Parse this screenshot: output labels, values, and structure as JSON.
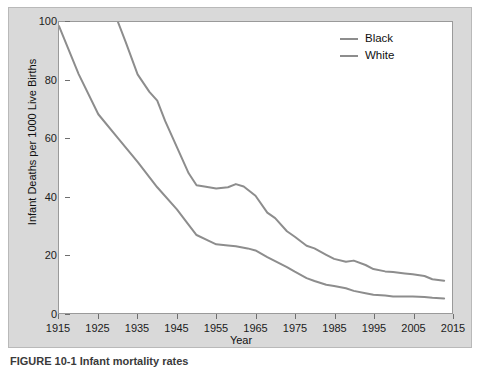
{
  "figure": {
    "caption": "FIGURE 10-1  Infant mortality rates"
  },
  "legend": {
    "position": "top-right",
    "entries": [
      {
        "label": "Black",
        "color": "#8d8d8d"
      },
      {
        "label": "White",
        "color": "#8d8d8d"
      }
    ]
  },
  "axes": {
    "x_title": "Year",
    "y_title": "Infant Deaths per 1000 Live Births",
    "x_ticks": [
      "1915",
      "1925",
      "1935",
      "1945",
      "1955",
      "1965",
      "1975",
      "1985",
      "1995",
      "2005",
      "2015"
    ],
    "y_ticks": [
      "0",
      "20",
      "40",
      "60",
      "80",
      "100"
    ]
  },
  "chart_data": {
    "type": "line",
    "title": "",
    "xlabel": "Year",
    "ylabel": "Infant Deaths per 1000 Live Births",
    "xlim": [
      1915,
      2015
    ],
    "ylim": [
      0,
      100
    ],
    "xticks": [
      1915,
      1925,
      1935,
      1945,
      1955,
      1965,
      1975,
      1985,
      1995,
      2005,
      2015
    ],
    "yticks": [
      0,
      20,
      40,
      60,
      80,
      100
    ],
    "grid": false,
    "legend_position": "top-right",
    "series": [
      {
        "name": "Black",
        "color": "#8d8d8d",
        "note": "Series enters the visible plot area at the top (value 100) near 1930; earlier values exceed the y-axis maximum.",
        "x": [
          1930,
          1932,
          1935,
          1938,
          1940,
          1942,
          1945,
          1948,
          1950,
          1952,
          1955,
          1958,
          1960,
          1962,
          1965,
          1968,
          1970,
          1973,
          1975,
          1978,
          1980,
          1983,
          1985,
          1988,
          1990,
          1993,
          1995,
          1998,
          2000,
          2003,
          2005,
          2008,
          2010,
          2013
        ],
        "y": [
          100,
          93,
          82,
          76,
          73,
          66,
          57,
          48,
          43.9,
          43.5,
          42.8,
          43.2,
          44.3,
          43.5,
          40.3,
          34.5,
          32.6,
          28.1,
          26.2,
          23.1,
          22.2,
          20.0,
          18.6,
          17.6,
          18.0,
          16.5,
          15.1,
          14.3,
          14.1,
          13.6,
          13.3,
          12.7,
          11.6,
          11.1
        ]
      },
      {
        "name": "White",
        "color": "#8d8d8d",
        "x": [
          1915,
          1920,
          1925,
          1930,
          1935,
          1940,
          1945,
          1948,
          1950,
          1953,
          1955,
          1958,
          1960,
          1963,
          1965,
          1968,
          1970,
          1973,
          1975,
          1978,
          1980,
          1983,
          1985,
          1988,
          1990,
          1993,
          1995,
          1998,
          2000,
          2003,
          2005,
          2008,
          2010,
          2013
        ],
        "y": [
          98.6,
          82.1,
          68.3,
          60.1,
          51.9,
          43.2,
          35.6,
          30.3,
          26.8,
          24.9,
          23.6,
          23.2,
          22.9,
          22.2,
          21.5,
          19.2,
          17.8,
          15.8,
          14.2,
          12.0,
          11.0,
          9.7,
          9.3,
          8.5,
          7.6,
          6.8,
          6.3,
          6.0,
          5.7,
          5.7,
          5.7,
          5.5,
          5.2,
          5.0
        ]
      }
    ]
  }
}
